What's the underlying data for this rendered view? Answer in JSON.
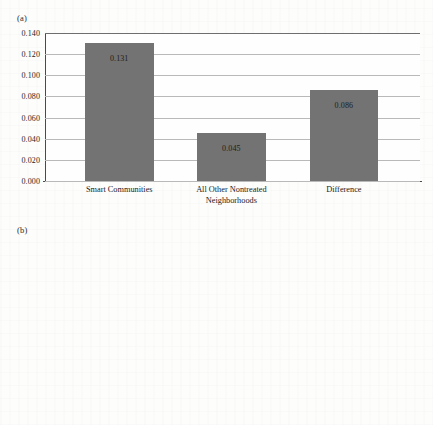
{
  "figure": {
    "background_color": "#fdfdfc",
    "bar_color": "#737373",
    "gridline_color": "#b9b9b9",
    "axis_color": "#4a4a4a"
  },
  "panels": [
    {
      "id": "a",
      "label": "(a)"
    },
    {
      "id": "b",
      "label": "(b)"
    }
  ],
  "chart_data": [
    {
      "type": "bar",
      "panel": "(a)",
      "title": "",
      "xlabel": "",
      "ylabel": "",
      "categories": [
        "Smart Communities",
        "All Other Nontreated\nNeighborhoods",
        "Difference"
      ],
      "values": [
        0.131,
        0.045,
        0.086
      ],
      "value_labels": [
        "0.131",
        "0.045",
        "0.086"
      ],
      "ylim": [
        0.0,
        0.14
      ],
      "ytick_labels": [
        "0.000",
        "0.020",
        "0.040",
        "0.060",
        "0.080",
        "0.100",
        "0.120",
        "0.140"
      ],
      "ytick_values": [
        0.0,
        0.02,
        0.04,
        0.06,
        0.08,
        0.1,
        0.12,
        0.14
      ],
      "grid": true,
      "legend": "none",
      "annotations": []
    },
    {
      "type": "bar",
      "panel": "(b)",
      "title": "",
      "xlabel": "",
      "ylabel": "",
      "categories": [
        "Smart Communities",
        "All Other Nontreated\nNeighborhoods",
        "Difference"
      ],
      "values": [
        0.147,
        0.06,
        0.086
      ],
      "value_labels": [
        "0.147",
        "0.060",
        "0.086"
      ],
      "ylim": [
        0.0,
        0.16
      ],
      "ytick_labels": [
        "0.000",
        "0.020",
        "0.040",
        "0.060",
        "0.080",
        "0.100",
        "0.120",
        "0.140",
        "0.160"
      ],
      "ytick_values": [
        0.0,
        0.02,
        0.04,
        0.06,
        0.08,
        0.1,
        0.12,
        0.14,
        0.16
      ],
      "grid": true,
      "legend": "none",
      "annotations": [
        {
          "target_category": "Difference",
          "text": "*"
        }
      ]
    }
  ]
}
